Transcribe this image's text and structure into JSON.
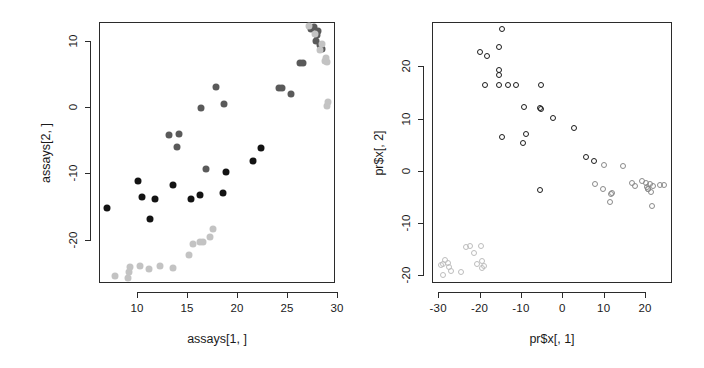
{
  "figure": {
    "background": "#ffffff",
    "panels": [
      "left",
      "right"
    ]
  },
  "chart_data": [
    {
      "panel": "left",
      "type": "scatter",
      "title": "",
      "xlabel": "assays[1, ]",
      "ylabel": "assays[2, ]",
      "xlim": [
        6.2,
        29.8
      ],
      "ylim": [
        -26.5,
        12.8
      ],
      "xticks": [
        10,
        15,
        20,
        25,
        30
      ],
      "yticks": [
        10,
        0,
        -10,
        -20
      ],
      "grid": false,
      "legend": null,
      "marker": "filled-circle",
      "marker_size_px": 7,
      "series": [
        {
          "name": "black-group",
          "color": "#131313",
          "x": [
            7.0,
            10.1,
            10.5,
            11.8,
            11.3,
            13.6,
            15.4,
            16.3,
            18.6,
            18.9,
            21.6,
            22.4
          ],
          "y": [
            -15.2,
            -11.1,
            -13.6,
            -13.9,
            -16.8,
            -11.7,
            -13.8,
            -13.2,
            -13.0,
            -9.8,
            -8.1,
            -6.2
          ]
        },
        {
          "name": "dark-gray-group",
          "color": "#5a5a5a",
          "x": [
            13.2,
            14.2,
            14.0,
            16.4,
            17.9,
            18.7,
            16.9,
            24.2,
            24.5,
            25.4,
            26.3,
            26.6,
            27.4,
            27.7,
            28.0,
            27.9,
            28.3,
            28.1,
            28.5
          ],
          "y": [
            -4.2,
            -4.1,
            -6.0,
            -0.2,
            3.0,
            0.4,
            -9.3,
            2.8,
            2.8,
            1.9,
            6.6,
            6.6,
            11.8,
            12.0,
            10.9,
            9.9,
            9.4,
            11.4,
            8.8
          ]
        },
        {
          "name": "light-gray-group",
          "color": "#c3c3c3",
          "x": [
            7.8,
            9.1,
            9.2,
            9.3,
            10.3,
            11.2,
            12.3,
            13.6,
            15.2,
            15.6,
            16.3,
            16.6,
            17.3,
            17.6,
            27.2,
            27.8,
            28.3,
            28.8,
            29.0,
            28.9,
            28.5,
            29.1,
            29.0
          ],
          "y": [
            -25.4,
            -25.7,
            -24.9,
            -24.1,
            -23.9,
            -24.4,
            -24.0,
            -24.2,
            -22.3,
            -20.7,
            -20.4,
            -20.4,
            -19.6,
            -18.3,
            12.2,
            11.0,
            8.6,
            7.0,
            6.8,
            7.4,
            9.5,
            0.7,
            0.1
          ]
        }
      ]
    },
    {
      "panel": "right",
      "type": "scatter",
      "title": "",
      "xlabel": "pr$x[, 1]",
      "ylabel": "pr$x[, 2]",
      "xlim": [
        -31.5,
        26.5
      ],
      "ylim": [
        -21.5,
        28.5
      ],
      "xticks": [
        -30,
        -20,
        -10,
        0,
        10,
        20
      ],
      "yticks": [
        20,
        10,
        0,
        -10,
        -20
      ],
      "grid": false,
      "legend": null,
      "marker": "open-circle",
      "marker_size_px": 6,
      "series": [
        {
          "name": "black-group",
          "color": "#1c1c1c",
          "x": [
            -14.6,
            -19.8,
            -18.2,
            -15.4,
            -15.2,
            -15.3,
            -18.8,
            -15.4,
            -13.2,
            -11.2,
            -5.2,
            -9.2,
            -5.5,
            -5.2,
            -2.2,
            -8.8,
            -9.4,
            -14.6,
            -5.4,
            2.9,
            5.7,
            7.6
          ],
          "y": [
            27.2,
            22.8,
            21.9,
            23.7,
            19.4,
            18.4,
            16.5,
            16.4,
            16.4,
            16.4,
            16.4,
            12.2,
            12.1,
            11.8,
            10.1,
            7.1,
            5.4,
            6.4,
            -3.6,
            8.2,
            2.7,
            1.9
          ]
        },
        {
          "name": "mid-gray-group",
          "color": "#8a8a8a",
          "x": [
            8.0,
            9.9,
            11.8,
            14.7,
            16.9,
            17.5,
            19.3,
            20.1,
            20.4,
            20.8,
            21.2,
            21.4,
            21.6,
            23.6,
            24.6,
            10.1,
            11.4,
            12.0,
            20.6,
            21.9
          ],
          "y": [
            -2.6,
            -3.5,
            -4.5,
            0.9,
            -2.3,
            -2.9,
            -2.0,
            -2.3,
            -3.1,
            -3.4,
            -2.6,
            -4.0,
            -6.7,
            -2.7,
            -2.8,
            1.1,
            -5.9,
            -4.2,
            -3.4,
            -2.9
          ]
        },
        {
          "name": "light-gray-group",
          "color": "#bdbdbd",
          "x": [
            -29.3,
            -28.9,
            -28.3,
            -27.7,
            -27.4,
            -28.8,
            -26.9,
            -24.4,
            -23.2,
            -22.4,
            -21.4,
            -20.6,
            -19.6,
            -19.4,
            -19.5,
            -18.9
          ],
          "y": [
            -18.1,
            -17.9,
            -17.1,
            -17.6,
            -18.4,
            -20.0,
            -19.2,
            -19.3,
            -14.6,
            -14.4,
            -15.7,
            -17.9,
            -14.5,
            -17.2,
            -18.6,
            -18.3
          ]
        }
      ]
    }
  ]
}
